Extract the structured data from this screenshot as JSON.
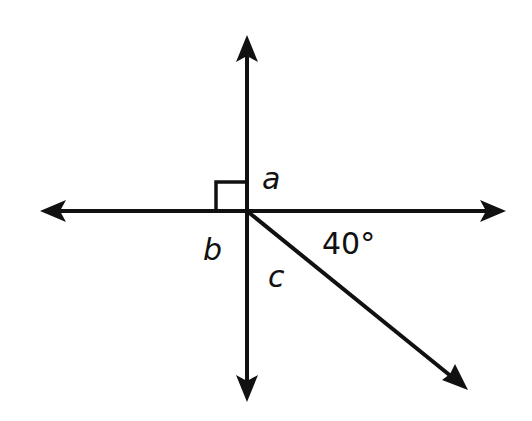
{
  "diagram": {
    "type": "geometry-angles",
    "labels": {
      "a": "a",
      "b": "b",
      "c": "c",
      "angle": "40°"
    },
    "elements": {
      "horizontal_line": "double-headed arrow line",
      "vertical_line": "double-headed arrow line",
      "ray": "arrow from intersection pointing down-right",
      "right_angle_marker": "square in upper-left quadrant"
    },
    "colors": {
      "line": "#111111",
      "background": "#ffffff"
    }
  }
}
